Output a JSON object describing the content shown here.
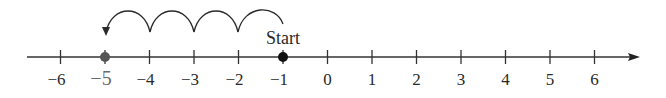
{
  "diagram": {
    "type": "number-line",
    "axis": {
      "min": -6,
      "max": 6,
      "arrow": "right",
      "color": "#333333"
    },
    "ticks": [
      {
        "value": -6,
        "label": "−6"
      },
      {
        "value": -5,
        "label": "−5",
        "highlight": true
      },
      {
        "value": -4,
        "label": "−4"
      },
      {
        "value": -3,
        "label": "−3"
      },
      {
        "value": -2,
        "label": "−2"
      },
      {
        "value": -1,
        "label": "−1"
      },
      {
        "value": 0,
        "label": "0"
      },
      {
        "value": 1,
        "label": "1"
      },
      {
        "value": 2,
        "label": "2"
      },
      {
        "value": 3,
        "label": "3"
      },
      {
        "value": 4,
        "label": "4"
      },
      {
        "value": 5,
        "label": "5"
      },
      {
        "value": 6,
        "label": "6"
      }
    ],
    "points": [
      {
        "value": -1,
        "label": "Start",
        "color": "#111111"
      },
      {
        "value": -5,
        "color": "#555555"
      }
    ],
    "jumps": {
      "from": -1,
      "to": -5,
      "step": -1,
      "count": 4
    },
    "start_label": "Start"
  }
}
